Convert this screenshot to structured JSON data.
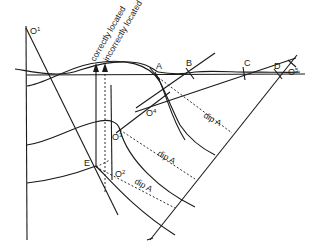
{
  "figure": {
    "type": "geological cross-section construction diagram",
    "arrow_labels": {
      "correct": "correctly located",
      "incorrect": "incorrectly located"
    },
    "surface_points": [
      "A",
      "B",
      "C",
      "D",
      "E"
    ],
    "centers": [
      {
        "base": "O",
        "sup": "1"
      },
      {
        "base": "O",
        "sup": "2"
      },
      {
        "base": "O",
        "sup": "3"
      },
      {
        "base": "O",
        "sup": "4"
      },
      {
        "base": "O",
        "sup": "5"
      }
    ],
    "dip_labels": [
      "dip A",
      "dip A",
      "dip A"
    ]
  }
}
